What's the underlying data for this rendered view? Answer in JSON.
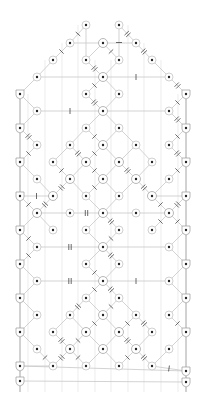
{
  "diagram": {
    "colors": {
      "edge": "#c8c8c8",
      "frame": "#9a9a9a",
      "node_fill": "#ffffff",
      "node_ring": "#bdbdbd",
      "node_dot": "#222222",
      "tick": "#444444"
    },
    "frame": {
      "left": 20,
      "right": 186,
      "top": 94,
      "bottom": 392
    },
    "nodes": [
      {
        "id": "n1",
        "x": 86,
        "y": 25
      },
      {
        "id": "n2",
        "x": 119,
        "y": 25
      },
      {
        "id": "n3",
        "x": 70,
        "y": 43
      },
      {
        "id": "n4",
        "x": 103,
        "y": 43,
        "center": true
      },
      {
        "id": "n5",
        "x": 136,
        "y": 43
      },
      {
        "id": "n6",
        "x": 53,
        "y": 60
      },
      {
        "id": "n7",
        "x": 86,
        "y": 60
      },
      {
        "id": "n8",
        "x": 119,
        "y": 60
      },
      {
        "id": "n9",
        "x": 152,
        "y": 60
      },
      {
        "id": "n10",
        "x": 37,
        "y": 77
      },
      {
        "id": "n11",
        "x": 103,
        "y": 77,
        "center": true
      },
      {
        "id": "n12",
        "x": 169,
        "y": 77
      },
      {
        "id": "n13",
        "x": 20,
        "y": 94,
        "side": true
      },
      {
        "id": "n14",
        "x": 86,
        "y": 94
      },
      {
        "id": "n15",
        "x": 119,
        "y": 94
      },
      {
        "id": "n16",
        "x": 186,
        "y": 94,
        "side": true
      },
      {
        "id": "n17",
        "x": 37,
        "y": 111
      },
      {
        "id": "n18",
        "x": 103,
        "y": 111,
        "center": true
      },
      {
        "id": "n19",
        "x": 169,
        "y": 111
      },
      {
        "id": "n20",
        "x": 20,
        "y": 128,
        "side": true
      },
      {
        "id": "n21",
        "x": 86,
        "y": 128
      },
      {
        "id": "n22",
        "x": 119,
        "y": 128
      },
      {
        "id": "n23",
        "x": 186,
        "y": 128,
        "side": true
      },
      {
        "id": "n24",
        "x": 37,
        "y": 145
      },
      {
        "id": "n25",
        "x": 70,
        "y": 145
      },
      {
        "id": "n26",
        "x": 103,
        "y": 145,
        "center": true
      },
      {
        "id": "n27",
        "x": 136,
        "y": 145
      },
      {
        "id": "n28",
        "x": 169,
        "y": 145
      },
      {
        "id": "n29",
        "x": 20,
        "y": 162,
        "side": true
      },
      {
        "id": "n30",
        "x": 53,
        "y": 162
      },
      {
        "id": "n31",
        "x": 86,
        "y": 162,
        "center": true
      },
      {
        "id": "n32",
        "x": 119,
        "y": 162,
        "center": true
      },
      {
        "id": "n33",
        "x": 152,
        "y": 162
      },
      {
        "id": "n34",
        "x": 186,
        "y": 162,
        "side": true
      },
      {
        "id": "n35",
        "x": 37,
        "y": 179
      },
      {
        "id": "n36",
        "x": 70,
        "y": 179,
        "center": true
      },
      {
        "id": "n37",
        "x": 103,
        "y": 179,
        "center": true
      },
      {
        "id": "n38",
        "x": 136,
        "y": 179,
        "center": true
      },
      {
        "id": "n39",
        "x": 169,
        "y": 179
      },
      {
        "id": "n40",
        "x": 20,
        "y": 196,
        "side": true
      },
      {
        "id": "n41",
        "x": 53,
        "y": 196,
        "center": true
      },
      {
        "id": "n42",
        "x": 86,
        "y": 196
      },
      {
        "id": "n43",
        "x": 119,
        "y": 196
      },
      {
        "id": "n44",
        "x": 152,
        "y": 196,
        "center": true
      },
      {
        "id": "n45",
        "x": 186,
        "y": 196,
        "side": true
      },
      {
        "id": "n46",
        "x": 37,
        "y": 213,
        "center": true
      },
      {
        "id": "n47",
        "x": 70,
        "y": 213
      },
      {
        "id": "n48",
        "x": 103,
        "y": 213,
        "center": true
      },
      {
        "id": "n49",
        "x": 136,
        "y": 213
      },
      {
        "id": "n50",
        "x": 169,
        "y": 213,
        "center": true
      },
      {
        "id": "n51",
        "x": 20,
        "y": 230,
        "side": true
      },
      {
        "id": "n52",
        "x": 53,
        "y": 230
      },
      {
        "id": "n53",
        "x": 86,
        "y": 230
      },
      {
        "id": "n54",
        "x": 119,
        "y": 230
      },
      {
        "id": "n55",
        "x": 152,
        "y": 230
      },
      {
        "id": "n56",
        "x": 186,
        "y": 230,
        "side": true
      },
      {
        "id": "n57",
        "x": 37,
        "y": 247
      },
      {
        "id": "n58",
        "x": 103,
        "y": 247,
        "center": true
      },
      {
        "id": "n59",
        "x": 169,
        "y": 247
      },
      {
        "id": "n60",
        "x": 20,
        "y": 264,
        "side": true
      },
      {
        "id": "n61",
        "x": 86,
        "y": 264
      },
      {
        "id": "n62",
        "x": 119,
        "y": 264
      },
      {
        "id": "n63",
        "x": 186,
        "y": 264,
        "side": true
      },
      {
        "id": "n64",
        "x": 37,
        "y": 281
      },
      {
        "id": "n65",
        "x": 103,
        "y": 281,
        "center": true
      },
      {
        "id": "n66",
        "x": 169,
        "y": 281
      },
      {
        "id": "n67",
        "x": 20,
        "y": 298,
        "side": true
      },
      {
        "id": "n68",
        "x": 86,
        "y": 298
      },
      {
        "id": "n69",
        "x": 119,
        "y": 298
      },
      {
        "id": "n70",
        "x": 186,
        "y": 298,
        "side": true
      },
      {
        "id": "n71",
        "x": 37,
        "y": 315
      },
      {
        "id": "n72",
        "x": 70,
        "y": 315
      },
      {
        "id": "n73",
        "x": 103,
        "y": 315,
        "center": true
      },
      {
        "id": "n74",
        "x": 136,
        "y": 315
      },
      {
        "id": "n75",
        "x": 169,
        "y": 315
      },
      {
        "id": "n76",
        "x": 20,
        "y": 332,
        "side": true
      },
      {
        "id": "n77",
        "x": 53,
        "y": 332
      },
      {
        "id": "n78",
        "x": 86,
        "y": 332,
        "center": true
      },
      {
        "id": "n79",
        "x": 119,
        "y": 332,
        "center": true
      },
      {
        "id": "n80",
        "x": 152,
        "y": 332
      },
      {
        "id": "n81",
        "x": 186,
        "y": 332,
        "side": true
      },
      {
        "id": "n82",
        "x": 37,
        "y": 349
      },
      {
        "id": "n83",
        "x": 70,
        "y": 349,
        "center": true
      },
      {
        "id": "n84",
        "x": 103,
        "y": 349,
        "center": true
      },
      {
        "id": "n85",
        "x": 136,
        "y": 349,
        "center": true
      },
      {
        "id": "n86",
        "x": 169,
        "y": 349
      },
      {
        "id": "n87",
        "x": 20,
        "y": 366,
        "side": true
      },
      {
        "id": "n88",
        "x": 53,
        "y": 366
      },
      {
        "id": "n89",
        "x": 86,
        "y": 366
      },
      {
        "id": "n90",
        "x": 119,
        "y": 366
      },
      {
        "id": "n91",
        "x": 152,
        "y": 366
      },
      {
        "id": "n92",
        "x": 186,
        "y": 371,
        "side": true
      },
      {
        "id": "n93",
        "x": 20,
        "y": 381,
        "side": true
      },
      {
        "id": "n94",
        "x": 186,
        "y": 382,
        "side": true
      }
    ],
    "edges": [
      [
        "n1",
        "n3"
      ],
      [
        "n1",
        "n7"
      ],
      [
        "n2",
        "n5"
      ],
      [
        "n2",
        "n8"
      ],
      [
        "n3",
        "n4"
      ],
      [
        "n4",
        "n5"
      ],
      [
        "n3",
        "n6"
      ],
      [
        "n5",
        "n9"
      ],
      [
        "n4",
        "n7"
      ],
      [
        "n4",
        "n8"
      ],
      [
        "n6",
        "n10"
      ],
      [
        "n9",
        "n12"
      ],
      [
        "n7",
        "n11"
      ],
      [
        "n8",
        "n11"
      ],
      [
        "n10",
        "n11"
      ],
      [
        "n11",
        "n12"
      ],
      [
        "n10",
        "n13"
      ],
      [
        "n12",
        "n16"
      ],
      [
        "n11",
        "n14"
      ],
      [
        "n11",
        "n15"
      ],
      [
        "n13",
        "n17"
      ],
      [
        "n16",
        "n19"
      ],
      [
        "n14",
        "n18"
      ],
      [
        "n15",
        "n18"
      ],
      [
        "n17",
        "n18"
      ],
      [
        "n18",
        "n19"
      ],
      [
        "n17",
        "n20"
      ],
      [
        "n19",
        "n23"
      ],
      [
        "n18",
        "n21"
      ],
      [
        "n18",
        "n22"
      ],
      [
        "n21",
        "n26"
      ],
      [
        "n22",
        "n26"
      ],
      [
        "n20",
        "n24"
      ],
      [
        "n23",
        "n28"
      ],
      [
        "n21",
        "n25"
      ],
      [
        "n22",
        "n27"
      ],
      [
        "n24",
        "n29"
      ],
      [
        "n28",
        "n34"
      ],
      [
        "n25",
        "n30"
      ],
      [
        "n26",
        "n31"
      ],
      [
        "n26",
        "n32"
      ],
      [
        "n27",
        "n33"
      ],
      [
        "n25",
        "n31"
      ],
      [
        "n27",
        "n32"
      ],
      [
        "n31",
        "n36"
      ],
      [
        "n31",
        "n37"
      ],
      [
        "n32",
        "n37"
      ],
      [
        "n32",
        "n38"
      ],
      [
        "n30",
        "n36"
      ],
      [
        "n33",
        "n38"
      ],
      [
        "n29",
        "n35"
      ],
      [
        "n34",
        "n39"
      ],
      [
        "n36",
        "n41"
      ],
      [
        "n36",
        "n42"
      ],
      [
        "n37",
        "n42"
      ],
      [
        "n37",
        "n43"
      ],
      [
        "n38",
        "n43"
      ],
      [
        "n38",
        "n44"
      ],
      [
        "n35",
        "n41"
      ],
      [
        "n39",
        "n44"
      ],
      [
        "n40",
        "n41"
      ],
      [
        "n44",
        "n45"
      ],
      [
        "n41",
        "n46"
      ],
      [
        "n44",
        "n50"
      ],
      [
        "n42",
        "n48"
      ],
      [
        "n43",
        "n48"
      ],
      [
        "n40",
        "n46"
      ],
      [
        "n45",
        "n50"
      ],
      [
        "n46",
        "n51"
      ],
      [
        "n50",
        "n56"
      ],
      [
        "n46",
        "n47"
      ],
      [
        "n49",
        "n50"
      ],
      [
        "n47",
        "n48"
      ],
      [
        "n48",
        "n49"
      ],
      [
        "n46",
        "n52"
      ],
      [
        "n50",
        "n55"
      ],
      [
        "n48",
        "n53"
      ],
      [
        "n48",
        "n54"
      ],
      [
        "n51",
        "n57"
      ],
      [
        "n56",
        "n59"
      ],
      [
        "n53",
        "n58"
      ],
      [
        "n54",
        "n58"
      ],
      [
        "n57",
        "n58"
      ],
      [
        "n58",
        "n59"
      ],
      [
        "n57",
        "n60"
      ],
      [
        "n59",
        "n63"
      ],
      [
        "n58",
        "n61"
      ],
      [
        "n58",
        "n62"
      ],
      [
        "n60",
        "n64"
      ],
      [
        "n63",
        "n66"
      ],
      [
        "n61",
        "n65"
      ],
      [
        "n62",
        "n65"
      ],
      [
        "n64",
        "n65"
      ],
      [
        "n65",
        "n66"
      ],
      [
        "n64",
        "n67"
      ],
      [
        "n66",
        "n70"
      ],
      [
        "n65",
        "n68"
      ],
      [
        "n65",
        "n69"
      ],
      [
        "n68",
        "n73"
      ],
      [
        "n69",
        "n73"
      ],
      [
        "n67",
        "n71"
      ],
      [
        "n70",
        "n75"
      ],
      [
        "n68",
        "n72"
      ],
      [
        "n69",
        "n74"
      ],
      [
        "n71",
        "n76"
      ],
      [
        "n75",
        "n81"
      ],
      [
        "n72",
        "n77"
      ],
      [
        "n74",
        "n80"
      ],
      [
        "n73",
        "n78"
      ],
      [
        "n73",
        "n79"
      ],
      [
        "n72",
        "n78"
      ],
      [
        "n74",
        "n79"
      ],
      [
        "n77",
        "n83"
      ],
      [
        "n80",
        "n85"
      ],
      [
        "n78",
        "n83"
      ],
      [
        "n78",
        "n84"
      ],
      [
        "n79",
        "n84"
      ],
      [
        "n79",
        "n85"
      ],
      [
        "n76",
        "n82"
      ],
      [
        "n81",
        "n86"
      ],
      [
        "n82",
        "n88"
      ],
      [
        "n86",
        "n91"
      ],
      [
        "n83",
        "n88"
      ],
      [
        "n83",
        "n89"
      ],
      [
        "n84",
        "n89"
      ],
      [
        "n84",
        "n90"
      ],
      [
        "n85",
        "n90"
      ],
      [
        "n85",
        "n91"
      ],
      [
        "n87",
        "n88"
      ],
      [
        "n91",
        "n92"
      ],
      [
        "n87",
        "n92"
      ],
      [
        "n93",
        "n94"
      ]
    ],
    "verticals": [
      {
        "x": 28,
        "y1": 94,
        "y2": 392
      },
      {
        "x": 45,
        "y1": 60,
        "y2": 392
      },
      {
        "x": 62,
        "y1": 43,
        "y2": 392
      },
      {
        "x": 78,
        "y1": 25,
        "y2": 392
      },
      {
        "x": 95,
        "y1": 60,
        "y2": 392
      },
      {
        "x": 111,
        "y1": 60,
        "y2": 392
      },
      {
        "x": 128,
        "y1": 25,
        "y2": 392
      },
      {
        "x": 144,
        "y1": 43,
        "y2": 392
      },
      {
        "x": 161,
        "y1": 60,
        "y2": 392
      },
      {
        "x": 178,
        "y1": 94,
        "y2": 392
      }
    ]
  }
}
